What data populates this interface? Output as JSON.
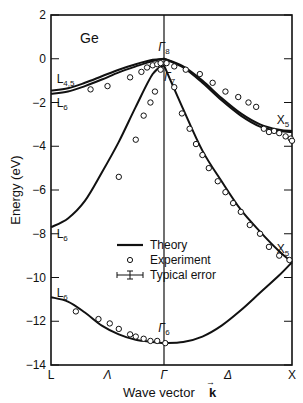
{
  "chart_data": {
    "type": "line",
    "title": "Ge",
    "material": "Ge",
    "xlabel": "Wave vector k",
    "ylabel": "Energy (eV)",
    "ylim": [
      -14,
      2
    ],
    "y_ticks": [
      2,
      0,
      -2,
      -4,
      -6,
      -8,
      -10,
      -12,
      -14
    ],
    "y_tick_labels": [
      "2",
      "0",
      "−2",
      "−4",
      "−6",
      "−8",
      "−10",
      "−12",
      "−14"
    ],
    "x_points": [
      "L",
      "Λ",
      "Γ",
      "Δ",
      "X"
    ],
    "x_point_positions": [
      -1,
      -0.5,
      0,
      0.5,
      1
    ],
    "grid": false,
    "legend_position": "center",
    "legend": [
      {
        "symbol": "line",
        "label": "Theory"
      },
      {
        "symbol": "circle",
        "label": "Experiment"
      },
      {
        "symbol": "errorbar",
        "label": "Typical error"
      }
    ],
    "point_labels": [
      {
        "text": "L",
        "sub": "4,5",
        "k": -0.95,
        "E": -1.1
      },
      {
        "text": "L",
        "sub": "6",
        "k": -0.95,
        "E": -2.2
      },
      {
        "text": "L",
        "sub": "6",
        "k": -0.95,
        "E": -8.2
      },
      {
        "text": "L",
        "sub": "6",
        "k": -0.95,
        "E": -10.9
      },
      {
        "text": "Γ",
        "sub": "8",
        "k": -0.05,
        "E": 0.35
      },
      {
        "text": "Γ",
        "sub": "7",
        "k": 0.0,
        "E": -1.0
      },
      {
        "text": "Γ",
        "sub": "6",
        "k": -0.05,
        "E": -12.5
      },
      {
        "text": "X",
        "sub": "5",
        "k": 0.88,
        "E": -3.0
      },
      {
        "text": "X",
        "sub": "5",
        "k": 0.88,
        "E": -8.9
      }
    ],
    "series": [
      {
        "name": "Theory (upper valence, heavy)",
        "kind": "theory",
        "k": [
          -1,
          -0.85,
          -0.7,
          -0.55,
          -0.4,
          -0.25,
          -0.1,
          0,
          0.15,
          0.3,
          0.45,
          0.6,
          0.75,
          0.9,
          1
        ],
        "E": [
          -1.45,
          -1.35,
          -1.1,
          -0.8,
          -0.5,
          -0.25,
          -0.05,
          0,
          -0.35,
          -1.0,
          -1.8,
          -2.5,
          -3.0,
          -3.25,
          -3.3
        ]
      },
      {
        "name": "Theory (upper valence, light)",
        "kind": "theory",
        "k": [
          -1,
          -0.85,
          -0.7,
          -0.55,
          -0.4,
          -0.25,
          -0.1,
          0,
          0.15,
          0.3,
          0.45,
          0.6,
          0.75,
          0.9,
          1
        ],
        "E": [
          -1.6,
          -1.5,
          -1.25,
          -0.95,
          -0.62,
          -0.35,
          -0.1,
          0,
          -0.4,
          -1.1,
          -1.9,
          -2.6,
          -3.1,
          -3.3,
          -3.35
        ]
      },
      {
        "name": "Theory (second valence)",
        "kind": "theory",
        "k": [
          -1,
          -0.85,
          -0.7,
          -0.55,
          -0.4,
          -0.25,
          -0.1,
          0,
          0.15,
          0.3,
          0.45,
          0.6,
          0.75,
          0.9,
          1
        ],
        "E": [
          -7.7,
          -7.3,
          -6.5,
          -5.2,
          -3.8,
          -2.2,
          -0.7,
          -0.3,
          -2.3,
          -4.2,
          -5.6,
          -6.9,
          -7.9,
          -8.8,
          -9.3
        ]
      },
      {
        "name": "Theory (lowest valence)",
        "kind": "theory",
        "k": [
          -1,
          -0.85,
          -0.7,
          -0.55,
          -0.4,
          -0.25,
          -0.1,
          0,
          0.15,
          0.3,
          0.45,
          0.6,
          0.75,
          0.9,
          1
        ],
        "E": [
          -10.9,
          -11.1,
          -11.6,
          -12.2,
          -12.6,
          -12.85,
          -12.95,
          -13.0,
          -12.95,
          -12.7,
          -12.2,
          -11.5,
          -10.7,
          -9.9,
          -9.3
        ]
      },
      {
        "name": "Experiment",
        "kind": "experiment",
        "k": [
          -0.65,
          -0.5,
          -0.3,
          -0.2,
          -0.15,
          -0.1,
          -0.06,
          -0.03,
          0.02,
          0.08,
          0.17,
          0.28,
          0.38,
          0.48,
          0.58,
          0.66,
          0.72,
          0.78,
          0.82,
          0.86,
          0.9,
          0.95,
          0.99,
          1.0,
          -0.4,
          -0.25,
          -0.18,
          -0.12,
          -0.08,
          -0.03,
          0.08,
          0.14,
          0.2,
          0.25,
          0.3,
          0.35,
          0.42,
          0.48,
          0.54,
          0.6,
          0.67,
          0.75,
          0.82,
          0.9,
          0.98,
          -0.78,
          -0.58,
          -0.48,
          -0.4,
          -0.3,
          -0.25,
          -0.18,
          -0.12,
          -0.06,
          0.01
        ],
        "E": [
          -1.4,
          -1.25,
          -0.85,
          -0.6,
          -0.4,
          -0.3,
          -0.25,
          -0.2,
          -0.2,
          -0.35,
          -0.5,
          -0.7,
          -1.1,
          -1.5,
          -1.75,
          -2.0,
          -2.2,
          -3.2,
          -3.35,
          -3.3,
          -3.4,
          -3.55,
          -3.65,
          -3.75,
          -5.4,
          -3.7,
          -2.6,
          -2.0,
          -1.5,
          -0.5,
          -1.3,
          -2.5,
          -3.2,
          -3.9,
          -4.4,
          -5.0,
          -5.6,
          -6.1,
          -6.6,
          -7.0,
          -7.6,
          -8.0,
          -8.6,
          -9.0,
          -9.2,
          -11.55,
          -11.9,
          -12.1,
          -12.35,
          -12.6,
          -12.7,
          -12.8,
          -12.9,
          -12.9,
          -13.0
        ]
      }
    ]
  },
  "axes": {
    "y_title": "Energy (eV)",
    "x_title_prefix": "Wave vector",
    "x_title_symbol": "k",
    "x_title_arrow": "→"
  },
  "legend": {
    "theory": "Theory",
    "experiment": "Experiment",
    "error": "Typical error"
  }
}
